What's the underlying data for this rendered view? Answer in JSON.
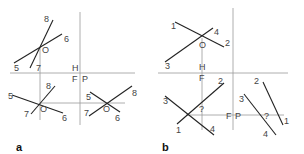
{
  "panels": [
    {
      "id": "a",
      "label": "a",
      "ref_labels": {
        "H": "H",
        "F": "F",
        "P": "P"
      },
      "views": {
        "top": {
          "O": "O",
          "p8": "8",
          "p7": "7",
          "p6": "6",
          "p5": "5"
        },
        "front": {
          "O": "O",
          "p8": "8",
          "p7": "7",
          "p6": "6",
          "p5": "5"
        },
        "profile": {
          "O": "O",
          "p8": "8",
          "p7": "7",
          "p6": "6",
          "p5": "5"
        }
      }
    },
    {
      "id": "b",
      "label": "b",
      "ref_labels": {
        "H": "H",
        "F1": "F",
        "F2": "F",
        "P": "P"
      },
      "views": {
        "top": {
          "O": "O",
          "p1": "1",
          "p2": "2",
          "p3": "3",
          "p4": "4"
        },
        "front": {
          "q": "?",
          "p1": "1",
          "p2": "2",
          "p3": "3",
          "p4": "4"
        },
        "profile": {
          "q": "?",
          "p1": "1",
          "p2": "2",
          "p3": "3",
          "p4": "4"
        }
      }
    }
  ],
  "colors": {
    "line": "#222222",
    "reference": "#999999",
    "text": "#444444"
  }
}
